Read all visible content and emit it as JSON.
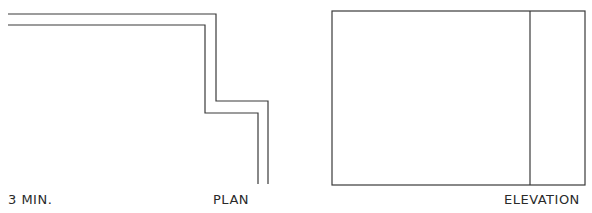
{
  "drawing": {
    "line_color": "#3a3a3a",
    "plan": {
      "label": "PLAN",
      "scale_label": "3 MIN.",
      "outer_path": "M8,14 L216,14 L216,101 L268,101 L268,184",
      "inner_path": "M8,25 L205,25 L205,113 L258,113 L258,184"
    },
    "elevation": {
      "label": "ELEVATION",
      "rect": {
        "x": 332,
        "y": 11,
        "width": 253,
        "height": 174
      },
      "divider_x": 530
    }
  }
}
